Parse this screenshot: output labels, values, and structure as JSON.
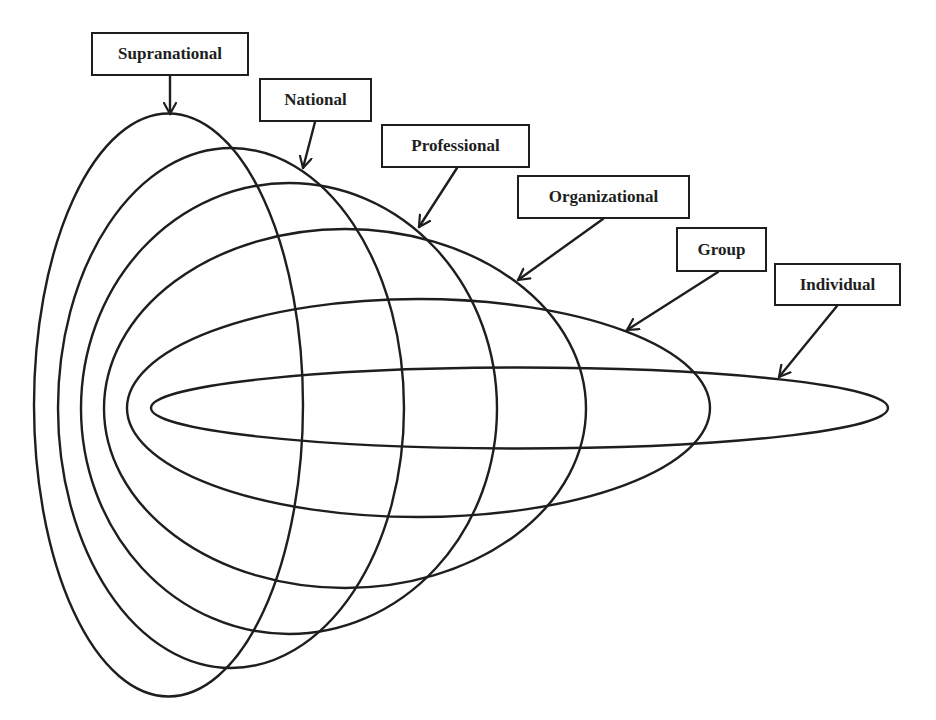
{
  "diagram": {
    "type": "nested-levels",
    "stroke_color": "#1e1e1e",
    "background": "#ffffff",
    "levels": [
      {
        "id": "supranational",
        "label": "Supranational",
        "shape": {
          "cx": 168.5,
          "cy": 405,
          "rx": 134.5,
          "ry": 291.5
        },
        "box": {
          "x": 91,
          "y": 32,
          "w": 158,
          "h": 44
        },
        "arrow": {
          "x1": 170,
          "y1": 76,
          "x2": 170,
          "y2": 114
        }
      },
      {
        "id": "national",
        "label": "National",
        "shape": {
          "cx": 231,
          "cy": 408,
          "rx": 173,
          "ry": 260
        },
        "box": {
          "x": 259,
          "y": 78,
          "w": 113,
          "h": 44
        },
        "arrow": {
          "x1": 315,
          "y1": 122,
          "x2": 303,
          "y2": 168
        }
      },
      {
        "id": "professional",
        "label": "Professional",
        "shape": {
          "cx": 289,
          "cy": 408.5,
          "rx": 208,
          "ry": 225.5
        },
        "box": {
          "x": 381,
          "y": 124,
          "w": 149,
          "h": 44
        },
        "arrow": {
          "x1": 457,
          "y1": 168,
          "x2": 419,
          "y2": 227
        }
      },
      {
        "id": "organizational",
        "label": "Organizational",
        "shape": {
          "cx": 345,
          "cy": 408.5,
          "rx": 241,
          "ry": 179.5
        },
        "box": {
          "x": 517,
          "y": 175,
          "w": 173,
          "h": 44
        },
        "arrow": {
          "x1": 603,
          "y1": 219,
          "x2": 518,
          "y2": 280
        }
      },
      {
        "id": "group",
        "label": "Group",
        "shape": {
          "cx": 418.5,
          "cy": 408,
          "rx": 291.5,
          "ry": 109
        },
        "box": {
          "x": 676,
          "y": 227,
          "w": 91,
          "h": 45
        },
        "arrow": {
          "x1": 718,
          "y1": 272,
          "x2": 627,
          "y2": 330
        }
      },
      {
        "id": "individual",
        "label": "Individual",
        "shape": {
          "cx": 519.5,
          "cy": 408,
          "rx": 368.5,
          "ry": 40.5
        },
        "box": {
          "x": 774,
          "y": 263,
          "w": 127,
          "h": 43
        },
        "arrow": {
          "x1": 837,
          "y1": 306,
          "x2": 779,
          "y2": 377
        }
      }
    ]
  }
}
